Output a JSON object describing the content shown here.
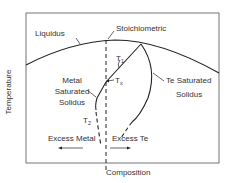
{
  "diagram": {
    "type": "phase-diagram",
    "axes": {
      "xlabel": "Composition",
      "ylabel": "Temperature"
    },
    "curves": {
      "liquidus": "Liquidus",
      "stoichiometric": "Stoichiometric",
      "metal_solidus": [
        "Metal",
        "Saturated",
        "Solidus"
      ],
      "te_solidus": [
        "Te Saturated",
        "Solidus"
      ]
    },
    "temperatures": {
      "t1": {
        "base": "T",
        "sub": "1"
      },
      "tx": {
        "base": "T",
        "sub": "x"
      },
      "t2": {
        "base": "T",
        "sub": "2"
      }
    },
    "regions": {
      "excess_metal": "Excess Metal",
      "excess_te": "Excess Te"
    },
    "colors": {
      "line": "#222222",
      "frame": "#555555",
      "text": "#333333"
    }
  }
}
